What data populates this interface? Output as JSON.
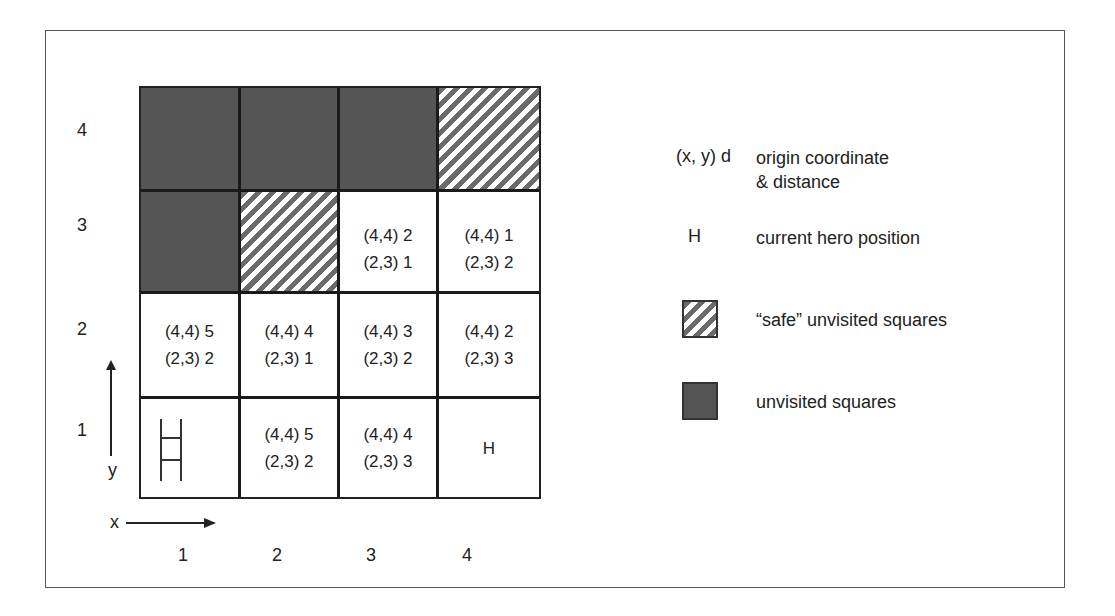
{
  "diagram": {
    "title": "",
    "grid_size": [
      4,
      4
    ],
    "x_axis": {
      "label": "x",
      "ticks": [
        "1",
        "2",
        "3",
        "4"
      ]
    },
    "y_axis": {
      "label": "y",
      "ticks": [
        "1",
        "2",
        "3",
        "4"
      ]
    },
    "colors": {
      "unvisited": "#555555",
      "safe_stripe": "#6a6a6a",
      "visited": "#ffffff",
      "grid_line": "#1a1a1a"
    },
    "rows": [
      {
        "y": "4",
        "cells": [
          {
            "x": 1,
            "type": "unvisited",
            "lines": []
          },
          {
            "x": 2,
            "type": "unvisited",
            "lines": []
          },
          {
            "x": 3,
            "type": "unvisited",
            "lines": []
          },
          {
            "x": 4,
            "type": "safe",
            "lines": []
          }
        ]
      },
      {
        "y": "3",
        "cells": [
          {
            "x": 1,
            "type": "unvisited",
            "lines": []
          },
          {
            "x": 2,
            "type": "safe",
            "lines": []
          },
          {
            "x": 3,
            "type": "visited",
            "lines": [
              "(4,4) 2",
              "(2,3) 1"
            ]
          },
          {
            "x": 4,
            "type": "visited",
            "lines": [
              "(4,4) 1",
              "(2,3) 2"
            ]
          }
        ]
      },
      {
        "y": "2",
        "cells": [
          {
            "x": 1,
            "type": "visited",
            "lines": [
              "(4,4) 5",
              "(2,3) 2"
            ]
          },
          {
            "x": 2,
            "type": "visited",
            "lines": [
              "(4,4) 4",
              "(2,3) 1"
            ]
          },
          {
            "x": 3,
            "type": "visited",
            "lines": [
              "(4,4) 3",
              "(2,3) 2"
            ]
          },
          {
            "x": 4,
            "type": "visited",
            "lines": [
              "(4,4) 2",
              "(2,3) 3"
            ]
          }
        ]
      },
      {
        "y": "1",
        "cells": [
          {
            "x": 1,
            "type": "visited",
            "icon": "ladder-icon",
            "lines": []
          },
          {
            "x": 2,
            "type": "visited",
            "lines": [
              "(4,4) 5",
              "(2,3) 2"
            ]
          },
          {
            "x": 3,
            "type": "visited",
            "lines": [
              "(4,4) 4",
              "(2,3) 3"
            ]
          },
          {
            "x": 4,
            "type": "visited",
            "lines": [
              "H"
            ]
          }
        ]
      }
    ]
  },
  "legend": {
    "items": [
      {
        "key": "(x, y) d",
        "desc": "origin coordinate",
        "desc2": "& distance"
      },
      {
        "key": "H",
        "desc": "current hero position"
      },
      {
        "key": "safe-swatch",
        "desc": "“safe” unvisited squares"
      },
      {
        "key": "unvisited-swatch",
        "desc": "unvisited squares"
      }
    ]
  }
}
